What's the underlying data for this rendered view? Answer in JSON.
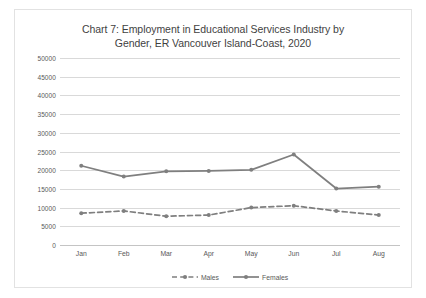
{
  "chart_data": {
    "type": "line",
    "title": "Chart 7: Employment in Educational Services Industry by Gender, ER Vancouver Island-Coast, 2020",
    "title_lines": [
      "Chart 7: Employment in Educational Services Industry by",
      "Gender, ER Vancouver Island-Coast, 2020"
    ],
    "xlabel": "",
    "ylabel": "",
    "categories": [
      "Jan",
      "Feb",
      "Mar",
      "Apr",
      "May",
      "Jun",
      "Jul",
      "Aug"
    ],
    "ylim": [
      0,
      50000
    ],
    "ytick_labels": [
      "50000",
      "45000",
      "40000",
      "35000",
      "30000",
      "25000",
      "20000",
      "15000",
      "10000",
      "5000",
      "0"
    ],
    "ytick_values": [
      50000,
      45000,
      40000,
      35000,
      30000,
      25000,
      20000,
      15000,
      10000,
      5000,
      0
    ],
    "grid": true,
    "legend_position": "bottom",
    "series": [
      {
        "name": "Males",
        "style": "dashed",
        "color": "#7f7f7f",
        "values": [
          8500,
          9100,
          7700,
          8000,
          10000,
          10500,
          9100,
          8000
        ]
      },
      {
        "name": "Females",
        "style": "solid",
        "color": "#7f7f7f",
        "values": [
          21200,
          18300,
          19700,
          19800,
          20100,
          24200,
          15100,
          15600
        ]
      }
    ]
  },
  "colors": {
    "series": "#7f7f7f",
    "gridline": "#d9d9d9",
    "axis_text": "#595959",
    "title_text": "#3f3f3f",
    "border": "#e2e2e2",
    "background": "#ffffff"
  }
}
